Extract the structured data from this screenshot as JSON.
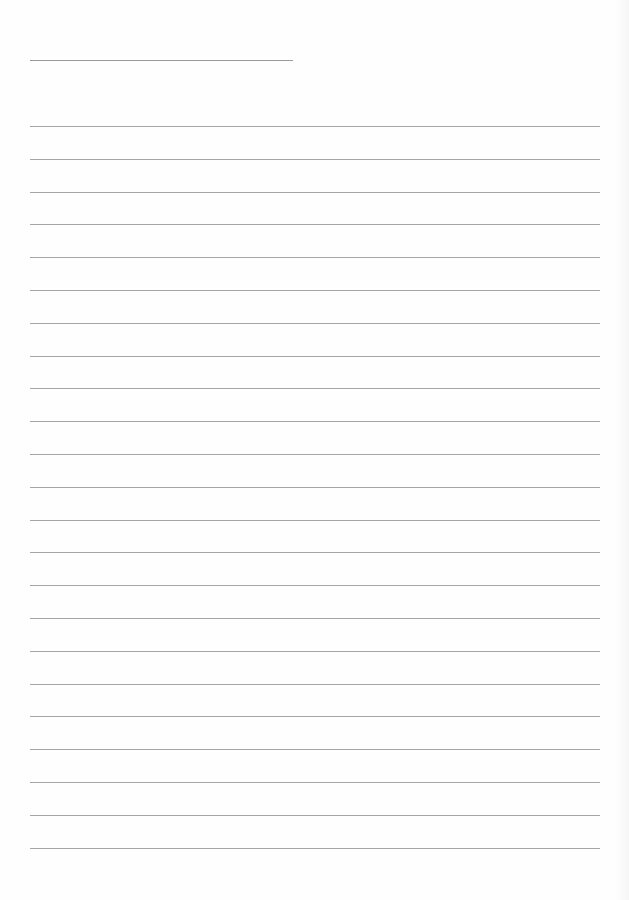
{
  "document": {
    "type": "ruled-blank-sheet",
    "title_line": {
      "x": 30,
      "y": 60,
      "width": 263
    },
    "ruled_lines": {
      "count": 23,
      "x": 30,
      "width": 570,
      "start_y": 126,
      "spacing": 32.8
    },
    "colors": {
      "paper": "#fefefe",
      "line": "#a6a6a6"
    }
  }
}
